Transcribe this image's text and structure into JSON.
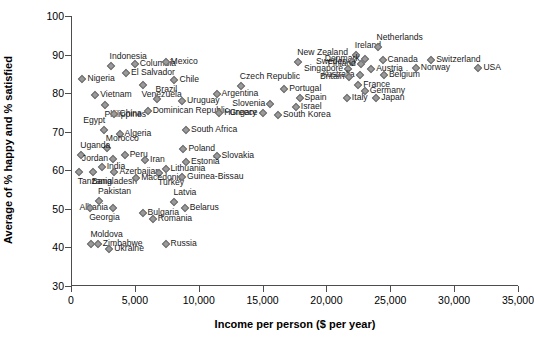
{
  "chart_data": {
    "type": "scatter",
    "title": "",
    "xlabel": "Income per person ($ per year)",
    "ylabel": "Average of % happy and % satisfied",
    "xlim": [
      0,
      35000
    ],
    "ylim": [
      30,
      100
    ],
    "xticks": [
      "0",
      "5,000",
      "10,000",
      "15,000",
      "20,000",
      "25,000",
      "30,000",
      "35,000"
    ],
    "xtick_values": [
      0,
      5000,
      10000,
      15000,
      20000,
      25000,
      30000,
      35000
    ],
    "yticks": [
      "30",
      "40",
      "50",
      "60",
      "70",
      "80",
      "90",
      "100"
    ],
    "ytick_values": [
      30,
      40,
      50,
      60,
      70,
      80,
      90,
      100
    ],
    "grid": false,
    "legend": "none",
    "marker_color": "#9a9a9a",
    "marker_edge_color": "#6e6e6e",
    "axis_color": "#4d4d4d",
    "points": [
      {
        "label": "Indonesia",
        "x": 3100,
        "y": 87.0,
        "pos": "t"
      },
      {
        "label": "Columbia",
        "x": 5000,
        "y": 87.6,
        "pos": "r"
      },
      {
        "label": "Mexico",
        "x": 7400,
        "y": 88.2,
        "pos": "r"
      },
      {
        "label": "El Salvador",
        "x": 4300,
        "y": 85.2,
        "pos": "r"
      },
      {
        "label": "Nigeria",
        "x": 900,
        "y": 83.7,
        "pos": "r"
      },
      {
        "label": "Chile",
        "x": 8100,
        "y": 83.4,
        "pos": "r"
      },
      {
        "label": "Venezuela",
        "x": 5600,
        "y": 82.0,
        "pos": "b"
      },
      {
        "label": "Vietnam",
        "x": 1900,
        "y": 79.5,
        "pos": "r"
      },
      {
        "label": "Czech Republic",
        "x": 13300,
        "y": 81.8,
        "pos": "t"
      },
      {
        "label": "Portugal",
        "x": 16700,
        "y": 81.0,
        "pos": "r"
      },
      {
        "label": "Argentina",
        "x": 11400,
        "y": 79.8,
        "pos": "r"
      },
      {
        "label": "Brazil",
        "x": 6700,
        "y": 78.4,
        "pos": "t"
      },
      {
        "label": "Uruguay",
        "x": 8700,
        "y": 78.0,
        "pos": "r"
      },
      {
        "label": "Spain",
        "x": 17900,
        "y": 78.7,
        "pos": "r"
      },
      {
        "label": "Philippines",
        "x": 2700,
        "y": 76.8,
        "pos": "b"
      },
      {
        "label": "Slovenia",
        "x": 15600,
        "y": 77.2,
        "pos": "l"
      },
      {
        "label": "Israel",
        "x": 17600,
        "y": 76.5,
        "pos": "r"
      },
      {
        "label": "Dominican Republic",
        "x": 6000,
        "y": 75.5,
        "pos": "r"
      },
      {
        "label": "Hungary",
        "x": 11600,
        "y": 74.8,
        "pos": "r"
      },
      {
        "label": "Greece",
        "x": 15000,
        "y": 74.8,
        "pos": "l"
      },
      {
        "label": "South Korea",
        "x": 16200,
        "y": 74.4,
        "pos": "r"
      },
      {
        "label": "China",
        "x": 3400,
        "y": 74.6,
        "pos": "r"
      },
      {
        "label": "Egypt",
        "x": 2600,
        "y": 70.5,
        "pos": "tl"
      },
      {
        "label": "South Africa",
        "x": 9000,
        "y": 70.4,
        "pos": "r"
      },
      {
        "label": "Algeria",
        "x": 3800,
        "y": 69.3,
        "pos": "r"
      },
      {
        "label": "Morocco",
        "x": 2800,
        "y": 65.7,
        "pos": "t"
      },
      {
        "label": "Poland",
        "x": 8800,
        "y": 65.6,
        "pos": "r"
      },
      {
        "label": "Uganda",
        "x": 800,
        "y": 64.0,
        "pos": "t"
      },
      {
        "label": "Peru",
        "x": 4200,
        "y": 63.9,
        "pos": "r"
      },
      {
        "label": "Slovakia",
        "x": 11400,
        "y": 63.8,
        "pos": "r"
      },
      {
        "label": "Jordan",
        "x": 3300,
        "y": 62.9,
        "pos": "l"
      },
      {
        "label": "Iran",
        "x": 5800,
        "y": 62.6,
        "pos": "r"
      },
      {
        "label": "Estonia",
        "x": 9000,
        "y": 62.1,
        "pos": "r"
      },
      {
        "label": "India",
        "x": 2400,
        "y": 60.9,
        "pos": "r"
      },
      {
        "label": "Lithuania",
        "x": 7400,
        "y": 60.4,
        "pos": "r"
      },
      {
        "label": "Azerbaijan",
        "x": 3400,
        "y": 59.6,
        "pos": "r"
      },
      {
        "label": "Turkey",
        "x": 6900,
        "y": 59.2,
        "pos": "b"
      },
      {
        "label": "Bangladesh",
        "x": 1700,
        "y": 59.5,
        "pos": "b"
      },
      {
        "label": "Tanzania",
        "x": 600,
        "y": 59.6,
        "pos": "b"
      },
      {
        "label": "Macedonia",
        "x": 5100,
        "y": 58.0,
        "pos": "r"
      },
      {
        "label": "Guinea-Bissau",
        "x": 8700,
        "y": 58.3,
        "pos": "r"
      },
      {
        "label": "Pakistan",
        "x": 2200,
        "y": 52.0,
        "pos": "t"
      },
      {
        "label": "Latvia",
        "x": 8100,
        "y": 51.8,
        "pos": "t"
      },
      {
        "label": "Albania",
        "x": 3300,
        "y": 50.3,
        "pos": "l"
      },
      {
        "label": "Belarus",
        "x": 8900,
        "y": 50.3,
        "pos": "r"
      },
      {
        "label": "Georgia",
        "x": 1500,
        "y": 50.2,
        "pos": "b"
      },
      {
        "label": "Bulgaria",
        "x": 5600,
        "y": 48.8,
        "pos": "r"
      },
      {
        "label": "Romania",
        "x": 6400,
        "y": 47.3,
        "pos": "r"
      },
      {
        "label": "Moldova",
        "x": 1600,
        "y": 40.8,
        "pos": "t"
      },
      {
        "label": "Zimbabwe",
        "x": 2100,
        "y": 41.0,
        "pos": "r"
      },
      {
        "label": "Russia",
        "x": 7400,
        "y": 40.8,
        "pos": "r"
      },
      {
        "label": "Ukraine",
        "x": 3000,
        "y": 39.5,
        "pos": "r"
      },
      {
        "label": "New Zealand",
        "x": 17800,
        "y": 88.2,
        "pos": "t"
      },
      {
        "label": "Ireland",
        "x": 22300,
        "y": 90.0,
        "pos": "t"
      },
      {
        "label": "Netherlands",
        "x": 24000,
        "y": 92.0,
        "pos": "t"
      },
      {
        "label": "Denmark",
        "x": 23000,
        "y": 88.8,
        "pos": "l"
      },
      {
        "label": "Canada",
        "x": 24400,
        "y": 88.5,
        "pos": "r"
      },
      {
        "label": "Switzerland",
        "x": 28200,
        "y": 88.5,
        "pos": "r"
      },
      {
        "label": "Sweden",
        "x": 22000,
        "y": 88.0,
        "pos": "l"
      },
      {
        "label": "Finland",
        "x": 22700,
        "y": 87.5,
        "pos": "l"
      },
      {
        "label": "Norway",
        "x": 27000,
        "y": 86.6,
        "pos": "r"
      },
      {
        "label": "USA",
        "x": 31900,
        "y": 86.5,
        "pos": "r"
      },
      {
        "label": "Singapore",
        "x": 21700,
        "y": 86.3,
        "pos": "l"
      },
      {
        "label": "Austria",
        "x": 23500,
        "y": 86.2,
        "pos": "r"
      },
      {
        "label": "Australia",
        "x": 22600,
        "y": 84.8,
        "pos": "l"
      },
      {
        "label": "Belgium",
        "x": 24500,
        "y": 84.6,
        "pos": "r"
      },
      {
        "label": "Britain",
        "x": 21800,
        "y": 84.3,
        "pos": "l"
      },
      {
        "label": "France",
        "x": 22500,
        "y": 82.2,
        "pos": "r"
      },
      {
        "label": "Germany",
        "x": 23000,
        "y": 80.5,
        "pos": "r"
      },
      {
        "label": "Italy",
        "x": 21600,
        "y": 78.8,
        "pos": "r"
      },
      {
        "label": "Japan",
        "x": 23900,
        "y": 78.7,
        "pos": "r"
      }
    ]
  }
}
